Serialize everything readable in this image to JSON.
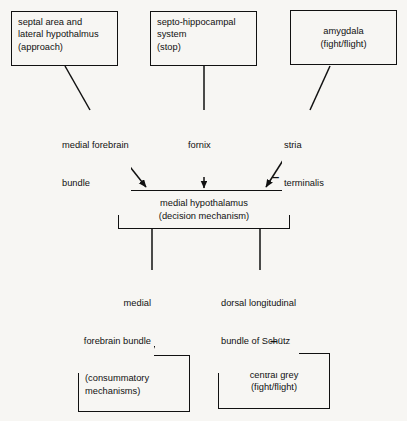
{
  "diagram": {
    "background_color": "#f7f6f3",
    "stroke_color": "#111111",
    "nodes": [
      {
        "id": "septal",
        "name": "septal-area-lateral-hypothalamus-box",
        "lines": [
          "septal area and",
          "lateral hypothalmus",
          "(approach)"
        ],
        "align": "left"
      },
      {
        "id": "septo",
        "name": "septo-hippocampal-system-box",
        "lines": [
          "septo-hippocampal",
          "system",
          "(stop)"
        ],
        "align": "left"
      },
      {
        "id": "amygdala",
        "name": "amygdala-box",
        "lines": [
          "amygdala",
          "(fight/flight)"
        ],
        "align": "center"
      },
      {
        "id": "medial_hypothalamus",
        "name": "medial-hypothalamus-box",
        "lines": [
          "medial hypothalamus",
          "(decision mechanism)"
        ],
        "align": "center"
      },
      {
        "id": "midbrain",
        "name": "midbrain-box",
        "lines": [
          "midbrain",
          "(consummatory",
          "mechanisms)"
        ],
        "align": "left"
      },
      {
        "id": "central_grey",
        "name": "central-grey-box",
        "lines": [
          "central grey",
          "(fight/flight)"
        ],
        "align": "center"
      }
    ],
    "edge_labels": [
      {
        "id": "mfb_upper",
        "name": "medial-forebrain-bundle-upper-label",
        "lines": [
          "medial forebrain",
          "bundle"
        ],
        "from": "septal",
        "to": "medial_hypothalamus"
      },
      {
        "id": "fornix",
        "name": "fornix-label",
        "lines": [
          "fornix"
        ],
        "from": "septo",
        "to": "medial_hypothalamus"
      },
      {
        "id": "stria",
        "name": "stria-terminalis-label",
        "lines": [
          "stria",
          "terminalis"
        ],
        "from": "amygdala",
        "to": "medial_hypothalamus"
      },
      {
        "id": "mfb_lower",
        "name": "medial-forebrain-bundle-lower-label",
        "lines": [
          "medial",
          "forebrain bundle"
        ],
        "from": "medial_hypothalamus",
        "to": "midbrain"
      },
      {
        "id": "schutz",
        "name": "dorsal-longitudinal-bundle-label",
        "lines": [
          "dorsal longitudinal",
          "bundle of Schütz"
        ],
        "from": "medial_hypothalamus",
        "to": "central_grey"
      }
    ],
    "annotations": [
      {
        "id": "minus_stria",
        "name": "minus-sign-stria-terminalis",
        "symbol": "–",
        "meaning": "inhibitory"
      },
      {
        "id": "minus_grey",
        "name": "minus-sign-central-grey",
        "symbol": "–",
        "meaning": "inhibitory"
      }
    ]
  }
}
